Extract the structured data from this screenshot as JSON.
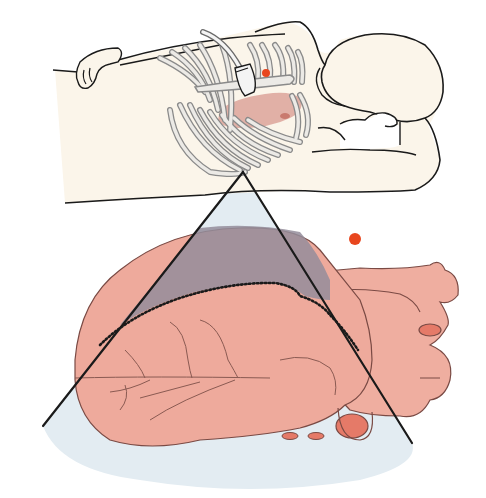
{
  "figure": {
    "width": 486,
    "height": 498
  },
  "colors": {
    "background": "#ffffff",
    "skin": "#fbf6ec",
    "outline": "#1a1a1a",
    "rib_fill": "#e9e6e1",
    "rib_stroke": "#8a8a8a",
    "heart": "#ee a89a",
    "heart_main": "#eeaa9c",
    "heart_shadow": "#e39585",
    "heart_stroke": "#7a4a44",
    "vessel_opening": "#e57a68",
    "vessel_line": "#8a5a52",
    "beam_fill": "#dfe8ef",
    "beam_overlap": "#8f8a98",
    "marker": "#e8461e",
    "probe": "#f4f4f4"
  },
  "annotations": {
    "marker_on_probe": {
      "cx": 266,
      "cy": 73,
      "r": 4
    },
    "marker_orientation": {
      "cx": 355,
      "cy": 239,
      "r": 6
    },
    "beam": {
      "apex": [
        243,
        172
      ],
      "left_base": [
        43,
        426
      ],
      "right_base": [
        412,
        443
      ]
    },
    "dotted_contour": "imaging plane boundary"
  }
}
